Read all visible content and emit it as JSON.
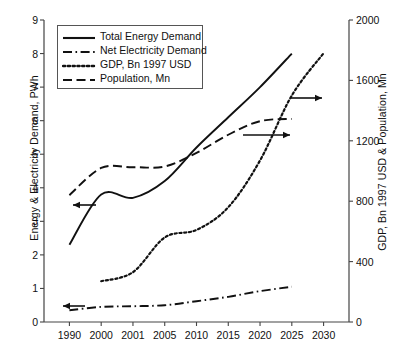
{
  "chart_data": {
    "type": "line",
    "title": "",
    "xlabel": "",
    "categories": [
      "1990",
      "2000",
      "2001",
      "2005",
      "2010",
      "2015",
      "2020",
      "2025",
      "2030"
    ],
    "grid": false,
    "legend_position": "upper-left",
    "axes": {
      "left": {
        "label": "Energy & Electricity Demand, PWh",
        "ticks": [
          "0",
          "1",
          "2",
          "3",
          "4",
          "5",
          "6",
          "7",
          "8",
          "9"
        ],
        "tick_values": [
          0,
          1,
          2,
          3,
          4,
          5,
          6,
          7,
          8,
          9
        ],
        "ylim": [
          0,
          9
        ]
      },
      "right": {
        "label": "GDP, Bn 1997 USD & Population, Mn",
        "ticks": [
          "0",
          "400",
          "800",
          "1200",
          "1600",
          "2000"
        ],
        "tick_values": [
          0,
          400,
          800,
          1200,
          1600,
          2000
        ],
        "ylim": [
          0,
          2000
        ]
      }
    },
    "series": [
      {
        "name": "Total Energy Demand",
        "axis": "left",
        "style": "solid",
        "arrow": "left",
        "x": [
          "1990",
          "2000",
          "2001",
          "2005",
          "2010",
          "2015",
          "2020",
          "2025"
        ],
        "values": [
          2.3,
          3.8,
          3.7,
          4.2,
          5.2,
          6.1,
          7.0,
          8.0
        ]
      },
      {
        "name": "Net Electricity Demand",
        "axis": "left",
        "style": "dash-dot",
        "arrow": "left",
        "x": [
          "1990",
          "2000",
          "2001",
          "2005",
          "2010",
          "2015",
          "2020",
          "2025"
        ],
        "values": [
          0.35,
          0.45,
          0.47,
          0.5,
          0.62,
          0.75,
          0.92,
          1.05
        ]
      },
      {
        "name": "GDP, Bn 1997 USD",
        "axis": "right",
        "style": "dotted",
        "arrow": "right",
        "x": [
          "2000",
          "2001",
          "2005",
          "2010",
          "2015",
          "2020",
          "2025",
          "2030"
        ],
        "values": [
          270,
          330,
          560,
          610,
          760,
          1070,
          1500,
          1780
        ]
      },
      {
        "name": "Population, Mn",
        "axis": "right",
        "style": "long-dash",
        "arrow": "right",
        "x": [
          "1990",
          "2000",
          "2001",
          "2005",
          "2010",
          "2015",
          "2020",
          "2025"
        ],
        "values": [
          840,
          1020,
          1025,
          1030,
          1120,
          1240,
          1330,
          1345
        ]
      }
    ],
    "annotations": [
      {
        "name": "arrow-total-energy-to-left-axis",
        "direction": "left"
      },
      {
        "name": "arrow-net-electricity-to-left-axis",
        "direction": "left"
      },
      {
        "name": "arrow-gdp-to-right-axis",
        "direction": "right"
      },
      {
        "name": "arrow-population-to-right-axis",
        "direction": "right"
      }
    ]
  },
  "legend": {
    "items": [
      {
        "label": "Total Energy Demand",
        "style": "solid"
      },
      {
        "label": "Net Electricity Demand",
        "style": "dash-dot"
      },
      {
        "label": "GDP, Bn 1997 USD",
        "style": "dotted"
      },
      {
        "label": "Population, Mn",
        "style": "long-dash"
      }
    ]
  },
  "colors": {
    "line": "#111111",
    "axis": "#444444",
    "background": "#ffffff"
  }
}
